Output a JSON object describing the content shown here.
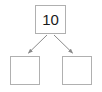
{
  "diagram": {
    "type": "number-bond",
    "title": "",
    "background_color": "#ffffff",
    "box_border_color": "#b0b0b0",
    "arrow_color": "#8a8a8a",
    "text_color": "#1a1a1a",
    "whole": {
      "label": "10",
      "name": "whole-box"
    },
    "parts": [
      {
        "label": "",
        "name": "part-left-box"
      },
      {
        "label": "",
        "name": "part-right-box"
      }
    ],
    "arrows": [
      {
        "name": "arrow-to-left-part",
        "from": "whole-box",
        "to": "part-left-box"
      },
      {
        "name": "arrow-to-right-part",
        "from": "whole-box",
        "to": "part-right-box"
      }
    ]
  }
}
